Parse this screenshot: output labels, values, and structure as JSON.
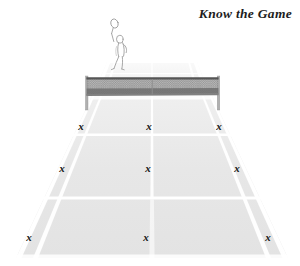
{
  "title": "Know the Game",
  "colors": {
    "background": "#ffffff",
    "court_surface": "#e6e6e6",
    "court_surface_far": "#ededed",
    "court_line": "#ffffff",
    "net_mesh": "#9a9a9a",
    "net_band": "#6e6e6e",
    "net_post": "#b5b5b5",
    "mark": "#171717",
    "player_stroke": "#9b9b9b",
    "title_text": "#1d1d1d"
  },
  "scene": {
    "view": "perspective tennis court from behind baseline",
    "net": {
      "label": "tennis-net",
      "left_post_label": "net-post-left",
      "right_post_label": "net-post-right"
    },
    "player": {
      "label": "tennis-player-figure",
      "description": "line drawing of player with raised racket behind the net"
    }
  },
  "chart_data": {
    "type": "scatter",
    "title": "Know the Game",
    "xlabel": "",
    "ylabel": "",
    "categories": [
      "left service box",
      "center service line",
      "right service box",
      "left sideline mid",
      "center mid",
      "right sideline mid",
      "left baseline corner",
      "center baseline",
      "right baseline corner"
    ],
    "marks": [
      {
        "id": 1,
        "label": "left service box",
        "row": "service-line",
        "column": "left",
        "x": 81,
        "y": 127
      },
      {
        "id": 2,
        "label": "center service line",
        "row": "service-line",
        "column": "center",
        "x": 149,
        "y": 127
      },
      {
        "id": 3,
        "label": "right service box",
        "row": "service-line",
        "column": "right",
        "x": 219,
        "y": 127
      },
      {
        "id": 4,
        "label": "left sideline mid",
        "row": "mid-court",
        "column": "left",
        "x": 62,
        "y": 169
      },
      {
        "id": 5,
        "label": "center mid",
        "row": "mid-court",
        "column": "center",
        "x": 148,
        "y": 169
      },
      {
        "id": 6,
        "label": "right sideline mid",
        "row": "mid-court",
        "column": "right",
        "x": 237,
        "y": 169
      },
      {
        "id": 7,
        "label": "left baseline corner",
        "row": "baseline",
        "column": "left",
        "x": 29,
        "y": 238
      },
      {
        "id": 8,
        "label": "center baseline",
        "row": "baseline",
        "column": "center",
        "x": 146,
        "y": 238
      },
      {
        "id": 9,
        "label": "right baseline corner",
        "row": "baseline",
        "column": "right",
        "x": 268,
        "y": 238
      }
    ],
    "mark_glyph": "x",
    "mark_count": 9,
    "grid": false,
    "legend": "none"
  }
}
